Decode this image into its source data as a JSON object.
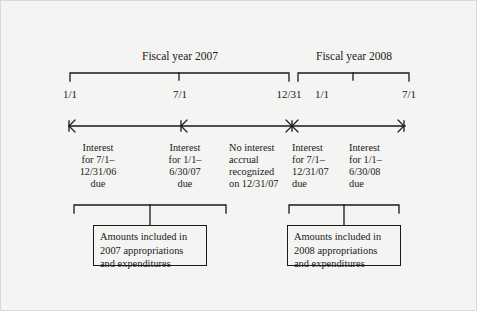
{
  "figure": {
    "fiscal_years": [
      {
        "title": "Fiscal year 2007"
      },
      {
        "title": "Fiscal year 2008"
      }
    ],
    "date_ticks": [
      {
        "label": "1/1"
      },
      {
        "label": "7/1"
      },
      {
        "label": "12/31"
      },
      {
        "label": "1/1"
      },
      {
        "label": "7/1"
      }
    ],
    "interval_notes": [
      {
        "text": "Interest\nfor 7/1–\n12/31/06\ndue"
      },
      {
        "text": "Interest\nfor 1/1–\n6/30/07\ndue"
      },
      {
        "text": "No interest\naccrual\nrecognized\non 12/31/07"
      },
      {
        "text": "Interest\nfor 7/1–\n12/31/07\ndue"
      },
      {
        "text": "Interest\nfor 1/1–\n6/30/08\ndue"
      }
    ],
    "summary_boxes": [
      {
        "text": "Amounts included in\n2007 appropriations\nand expenditures"
      },
      {
        "text": "Amounts included in\n2008 appropriations\nand expenditures"
      }
    ],
    "colors": {
      "ink": "#1a1a1a",
      "page": "#f4f4f3",
      "border": "#d9d9d7"
    }
  }
}
